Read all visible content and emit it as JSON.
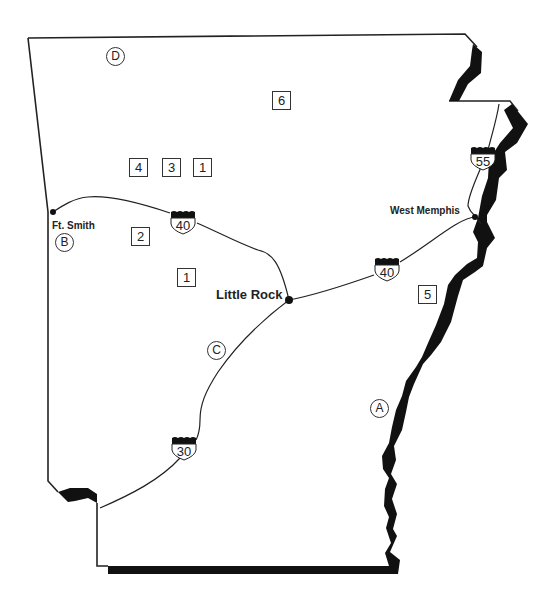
{
  "map": {
    "region": "Arkansas",
    "colors": {
      "outline": "#222222",
      "river": "#111111",
      "background": "#ffffff",
      "text": "#222222"
    }
  },
  "cities": [
    {
      "name": "Ft. Smith",
      "x": 53,
      "y": 212,
      "bold": false
    },
    {
      "name": "Little Rock",
      "x": 289,
      "y": 300,
      "bold": true
    },
    {
      "name": "West Memphis",
      "x": 475,
      "y": 217,
      "bold": false
    }
  ],
  "interstates": [
    {
      "id": "i40-west",
      "number": "40",
      "x": 183,
      "y": 220
    },
    {
      "id": "i40-east",
      "number": "40",
      "x": 387,
      "y": 268
    },
    {
      "id": "i55",
      "number": "55",
      "x": 483,
      "y": 158
    },
    {
      "id": "i30",
      "number": "30",
      "x": 184,
      "y": 447
    }
  ],
  "boxed_markers": [
    {
      "label": "6",
      "x": 281,
      "y": 100
    },
    {
      "label": "4",
      "x": 138,
      "y": 167
    },
    {
      "label": "3",
      "x": 171,
      "y": 167
    },
    {
      "label": "1",
      "x": 202,
      "y": 167
    },
    {
      "label": "2",
      "x": 140,
      "y": 236
    },
    {
      "label": "1",
      "x": 186,
      "y": 277
    },
    {
      "label": "5",
      "x": 427,
      "y": 294
    }
  ],
  "circled_markers": [
    {
      "label": "D",
      "x": 115,
      "y": 56
    },
    {
      "label": "B",
      "x": 64,
      "y": 242
    },
    {
      "label": "C",
      "x": 216,
      "y": 350
    },
    {
      "label": "A",
      "x": 379,
      "y": 408
    }
  ]
}
